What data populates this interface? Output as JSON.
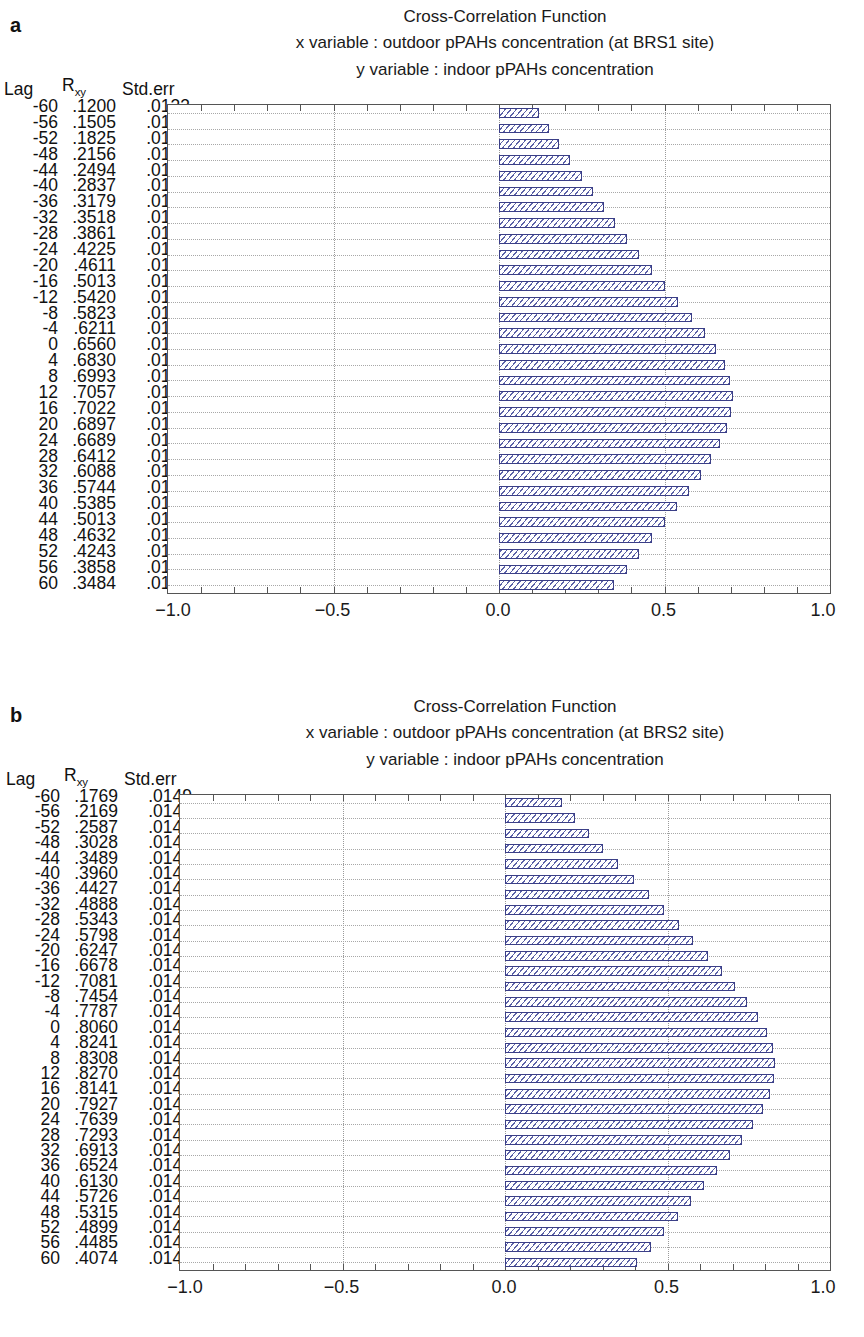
{
  "panels": [
    {
      "letter": "a",
      "title": "Cross-Correlation Function",
      "x_variable_line": "x variable : outdoor pPAHs concentration (at BRS1 site)",
      "y_variable_line": "y variable : indoor pPAHs concentration",
      "columns": {
        "lag": "Lag",
        "rxy_base": "R",
        "rxy_sub": "xy",
        "stderr": "Std.err"
      },
      "axis_ticks": [
        "-1.0",
        "-0.5",
        "0.0",
        "0.5",
        "1.0"
      ],
      "rows": [
        {
          "lag": "-60",
          "rxy": ".1200",
          "stderr": ".0133"
        },
        {
          "lag": "-56",
          "rxy": ".1505",
          "stderr": ".0133"
        },
        {
          "lag": "-52",
          "rxy": ".1825",
          "stderr": ".0133"
        },
        {
          "lag": "-48",
          "rxy": ".2156",
          "stderr": ".0133"
        },
        {
          "lag": "-44",
          "rxy": ".2494",
          "stderr": ".0133"
        },
        {
          "lag": "-40",
          "rxy": ".2837",
          "stderr": ".0133"
        },
        {
          "lag": "-36",
          "rxy": ".3179",
          "stderr": ".0133"
        },
        {
          "lag": "-32",
          "rxy": ".3518",
          "stderr": ".0133"
        },
        {
          "lag": "-28",
          "rxy": ".3861",
          "stderr": ".0133"
        },
        {
          "lag": "-24",
          "rxy": ".4225",
          "stderr": ".0133"
        },
        {
          "lag": "-20",
          "rxy": ".4611",
          "stderr": ".0133"
        },
        {
          "lag": "-16",
          "rxy": ".5013",
          "stderr": ".0133"
        },
        {
          "lag": "-12",
          "rxy": ".5420",
          "stderr": ".0133"
        },
        {
          "lag": "-8",
          "rxy": ".5823",
          "stderr": ".0133"
        },
        {
          "lag": "-4",
          "rxy": ".6211",
          "stderr": ".0133"
        },
        {
          "lag": "0",
          "rxy": ".6560",
          "stderr": ".0133"
        },
        {
          "lag": "4",
          "rxy": ".6830",
          "stderr": ".0133"
        },
        {
          "lag": "8",
          "rxy": ".6993",
          "stderr": ".0133"
        },
        {
          "lag": "12",
          "rxy": ".7057",
          "stderr": ".0133"
        },
        {
          "lag": "16",
          "rxy": ".7022",
          "stderr": ".0133"
        },
        {
          "lag": "20",
          "rxy": ".6897",
          "stderr": ".0133"
        },
        {
          "lag": "24",
          "rxy": ".6689",
          "stderr": ".0133"
        },
        {
          "lag": "28",
          "rxy": ".6412",
          "stderr": ".0133"
        },
        {
          "lag": "32",
          "rxy": ".6088",
          "stderr": ".0133"
        },
        {
          "lag": "36",
          "rxy": ".5744",
          "stderr": ".0133"
        },
        {
          "lag": "40",
          "rxy": ".5385",
          "stderr": ".0133"
        },
        {
          "lag": "44",
          "rxy": ".5013",
          "stderr": ".0133"
        },
        {
          "lag": "48",
          "rxy": ".4632",
          "stderr": ".0133"
        },
        {
          "lag": "52",
          "rxy": ".4243",
          "stderr": ".0133"
        },
        {
          "lag": "56",
          "rxy": ".3858",
          "stderr": ".0133"
        },
        {
          "lag": "60",
          "rxy": ".3484",
          "stderr": ".0133"
        }
      ]
    },
    {
      "letter": "b",
      "title": "Cross-Correlation Function",
      "x_variable_line": "x variable : outdoor pPAHs concentration (at BRS2 site)",
      "y_variable_line": "y variable : indoor pPAHs concentration",
      "columns": {
        "lag": "Lag",
        "rxy_base": "R",
        "rxy_sub": "xy",
        "stderr": "Std.err"
      },
      "axis_ticks": [
        "-1.0",
        "-0.5",
        "0.0",
        "0.5",
        "1.0"
      ],
      "rows": [
        {
          "lag": "-60",
          "rxy": ".1769",
          "stderr": ".0149"
        },
        {
          "lag": "-56",
          "rxy": ".2169",
          "stderr": ".0148"
        },
        {
          "lag": "-52",
          "rxy": ".2587",
          "stderr": ".0148"
        },
        {
          "lag": "-48",
          "rxy": ".3028",
          "stderr": ".0148"
        },
        {
          "lag": "-44",
          "rxy": ".3489",
          "stderr": ".0148"
        },
        {
          "lag": "-40",
          "rxy": ".3960",
          "stderr": ".0148"
        },
        {
          "lag": "-36",
          "rxy": ".4427",
          "stderr": ".0148"
        },
        {
          "lag": "-32",
          "rxy": ".4888",
          "stderr": ".0148"
        },
        {
          "lag": "-28",
          "rxy": ".5343",
          "stderr": ".0148"
        },
        {
          "lag": "-24",
          "rxy": ".5798",
          "stderr": ".0148"
        },
        {
          "lag": "-20",
          "rxy": ".6247",
          "stderr": ".0148"
        },
        {
          "lag": "-16",
          "rxy": ".6678",
          "stderr": ".0148"
        },
        {
          "lag": "-12",
          "rxy": ".7081",
          "stderr": ".0148"
        },
        {
          "lag": "-8",
          "rxy": ".7454",
          "stderr": ".0148"
        },
        {
          "lag": "-4",
          "rxy": ".7787",
          "stderr": ".0148"
        },
        {
          "lag": "0",
          "rxy": ".8060",
          "stderr": ".0148"
        },
        {
          "lag": "4",
          "rxy": ".8241",
          "stderr": ".0148"
        },
        {
          "lag": "8",
          "rxy": ".8308",
          "stderr": ".0148"
        },
        {
          "lag": "12",
          "rxy": ".8270",
          "stderr": ".0148"
        },
        {
          "lag": "16",
          "rxy": ".8141",
          "stderr": ".0148"
        },
        {
          "lag": "20",
          "rxy": ".7927",
          "stderr": ".0148"
        },
        {
          "lag": "24",
          "rxy": ".7639",
          "stderr": ".0148"
        },
        {
          "lag": "28",
          "rxy": ".7293",
          "stderr": ".0148"
        },
        {
          "lag": "32",
          "rxy": ".6913",
          "stderr": ".0148"
        },
        {
          "lag": "36",
          "rxy": ".6524",
          "stderr": ".0148"
        },
        {
          "lag": "40",
          "rxy": ".6130",
          "stderr": ".0148"
        },
        {
          "lag": "44",
          "rxy": ".5726",
          "stderr": ".0148"
        },
        {
          "lag": "48",
          "rxy": ".5315",
          "stderr": ".0148"
        },
        {
          "lag": "52",
          "rxy": ".4899",
          "stderr": ".0148"
        },
        {
          "lag": "56",
          "rxy": ".4485",
          "stderr": ".0148"
        },
        {
          "lag": "60",
          "rxy": ".4074",
          "stderr": ".0149"
        }
      ]
    }
  ],
  "chart_data": [
    {
      "type": "bar",
      "orientation": "horizontal",
      "title": "Cross-Correlation Function",
      "subtitle": "x variable : outdoor pPAHs concentration (at BRS1 site) / y variable : indoor pPAHs concentration",
      "xlabel": "",
      "ylabel": "Lag",
      "xlim": [
        -1.0,
        1.0
      ],
      "xticks": [
        -1.0,
        -0.5,
        0.0,
        0.5,
        1.0
      ],
      "grid": true,
      "legend": "none",
      "categories": [
        -60,
        -56,
        -52,
        -48,
        -44,
        -40,
        -36,
        -32,
        -28,
        -24,
        -20,
        -16,
        -12,
        -8,
        -4,
        0,
        4,
        8,
        12,
        16,
        20,
        24,
        28,
        32,
        36,
        40,
        44,
        48,
        52,
        56,
        60
      ],
      "values": [
        0.12,
        0.1505,
        0.1825,
        0.2156,
        0.2494,
        0.2837,
        0.3179,
        0.3518,
        0.3861,
        0.4225,
        0.4611,
        0.5013,
        0.542,
        0.5823,
        0.6211,
        0.656,
        0.683,
        0.6993,
        0.7057,
        0.7022,
        0.6897,
        0.6689,
        0.6412,
        0.6088,
        0.5744,
        0.5385,
        0.5013,
        0.4632,
        0.4243,
        0.3858,
        0.3484
      ],
      "stderr": [
        0.0133,
        0.0133,
        0.0133,
        0.0133,
        0.0133,
        0.0133,
        0.0133,
        0.0133,
        0.0133,
        0.0133,
        0.0133,
        0.0133,
        0.0133,
        0.0133,
        0.0133,
        0.0133,
        0.0133,
        0.0133,
        0.0133,
        0.0133,
        0.0133,
        0.0133,
        0.0133,
        0.0133,
        0.0133,
        0.0133,
        0.0133,
        0.0133,
        0.0133,
        0.0133,
        0.0133
      ]
    },
    {
      "type": "bar",
      "orientation": "horizontal",
      "title": "Cross-Correlation Function",
      "subtitle": "x variable : outdoor pPAHs concentration (at BRS2 site) / y variable : indoor pPAHs concentration",
      "xlabel": "",
      "ylabel": "Lag",
      "xlim": [
        -1.0,
        1.0
      ],
      "xticks": [
        -1.0,
        -0.5,
        0.0,
        0.5,
        1.0
      ],
      "grid": true,
      "legend": "none",
      "categories": [
        -60,
        -56,
        -52,
        -48,
        -44,
        -40,
        -36,
        -32,
        -28,
        -24,
        -20,
        -16,
        -12,
        -8,
        -4,
        0,
        4,
        8,
        12,
        16,
        20,
        24,
        28,
        32,
        36,
        40,
        44,
        48,
        52,
        56,
        60
      ],
      "values": [
        0.1769,
        0.2169,
        0.2587,
        0.3028,
        0.3489,
        0.396,
        0.4427,
        0.4888,
        0.5343,
        0.5798,
        0.6247,
        0.6678,
        0.7081,
        0.7454,
        0.7787,
        0.806,
        0.8241,
        0.8308,
        0.827,
        0.8141,
        0.7927,
        0.7639,
        0.7293,
        0.6913,
        0.6524,
        0.613,
        0.5726,
        0.5315,
        0.4899,
        0.4485,
        0.4074
      ],
      "stderr": [
        0.0149,
        0.0148,
        0.0148,
        0.0148,
        0.0148,
        0.0148,
        0.0148,
        0.0148,
        0.0148,
        0.0148,
        0.0148,
        0.0148,
        0.0148,
        0.0148,
        0.0148,
        0.0148,
        0.0148,
        0.0148,
        0.0148,
        0.0148,
        0.0148,
        0.0148,
        0.0148,
        0.0148,
        0.0148,
        0.0148,
        0.0148,
        0.0148,
        0.0148,
        0.0148,
        0.0149
      ]
    }
  ]
}
